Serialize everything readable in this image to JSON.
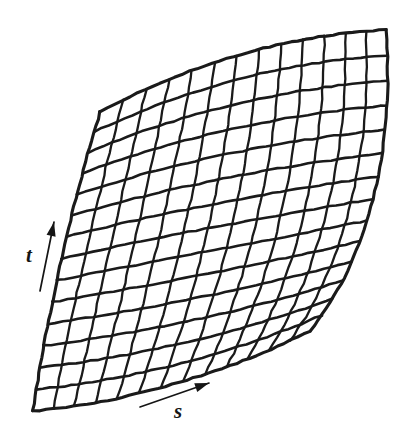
{
  "figure": {
    "kind": "parametric-surface-patch-mesh",
    "background_color": "#ffffff",
    "ink_color": "#1a1a1a",
    "width": 407,
    "height": 443
  },
  "labels": {
    "t": "t",
    "s": "s"
  },
  "axes": [
    {
      "name": "t-direction",
      "label": "t",
      "label_x": 26,
      "label_y": 262,
      "font_size": 21,
      "arrow_from": [
        40,
        291
      ],
      "arrow_to": [
        54,
        222
      ],
      "head_angle_deg": -78
    },
    {
      "name": "s-direction",
      "label": "s",
      "label_x": 174,
      "label_y": 418,
      "font_size": 21,
      "arrow_from": [
        140,
        407
      ],
      "arrow_to": [
        209,
        383
      ],
      "head_angle_deg": -19
    }
  ],
  "chart_data": {
    "type": "mesh",
    "title": "",
    "xlabel": "s",
    "ylabel": "t",
    "grid": true,
    "legend": null,
    "u_divisions": 13,
    "v_divisions": 14,
    "stroke_width_main": 2.6,
    "stroke_width_cross": 2.3,
    "corners": {
      "top_left": [
        100,
        112
      ],
      "top_right": [
        386,
        30
      ],
      "bottom_right": [
        310,
        331
      ],
      "bottom_left": [
        33,
        411
      ]
    },
    "edges": {
      "top": {
        "note": "s-direction boundary at t = 1, bows upward (concave toward patch interior)",
        "control_points": [
          [
            100,
            112
          ],
          [
            200,
            58
          ],
          [
            300,
            34
          ],
          [
            386,
            30
          ]
        ]
      },
      "right": {
        "note": "t-direction boundary at s = 1, bows rightward",
        "control_points": [
          [
            386,
            30
          ],
          [
            395,
            150
          ],
          [
            368,
            260
          ],
          [
            310,
            331
          ]
        ]
      },
      "bottom": {
        "note": "s-direction boundary at t = 0, bows downward then rises to the right",
        "control_points": [
          [
            33,
            411
          ],
          [
            120,
            404
          ],
          [
            225,
            374
          ],
          [
            310,
            331
          ]
        ]
      },
      "left": {
        "note": "t-direction boundary at s = 0, bows leftward slightly",
        "control_points": [
          [
            100,
            112
          ],
          [
            72,
            205
          ],
          [
            48,
            310
          ],
          [
            33,
            411
          ]
        ]
      }
    }
  }
}
